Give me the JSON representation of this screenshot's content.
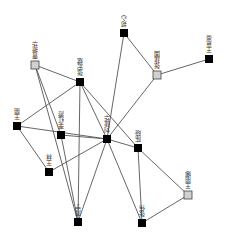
{
  "graph": {
    "type": "network",
    "nodes": [
      {
        "id": "A",
        "label": "曹振华",
        "x": 35,
        "y": 65,
        "style": "gray"
      },
      {
        "id": "B",
        "label": "张宏斌",
        "x": 80,
        "y": 82,
        "style": "black"
      },
      {
        "id": "C",
        "label": "郑心",
        "x": 124,
        "y": 33,
        "style": "black"
      },
      {
        "id": "D",
        "label": "张建国",
        "x": 157,
        "y": 75,
        "style": "gray"
      },
      {
        "id": "E",
        "label": "王嘉豪",
        "x": 209,
        "y": 59,
        "style": "black"
      },
      {
        "id": "F",
        "label": "王丽",
        "x": 17,
        "y": 126,
        "style": "black"
      },
      {
        "id": "G",
        "label": "李红霞",
        "x": 61,
        "y": 135,
        "style": "black"
      },
      {
        "id": "H",
        "label": "刘建华",
        "x": 107,
        "y": 139,
        "style": "black"
      },
      {
        "id": "I",
        "label": "陈晓",
        "x": 138,
        "y": 148,
        "style": "black"
      },
      {
        "id": "J",
        "label": "王林",
        "x": 49,
        "y": 172,
        "style": "black"
      },
      {
        "id": "K",
        "label": "王丽娜",
        "x": 188,
        "y": 195,
        "style": "gray"
      },
      {
        "id": "L",
        "label": "张伟",
        "x": 142,
        "y": 223,
        "style": "black"
      },
      {
        "id": "M",
        "label": "周宁",
        "x": 78,
        "y": 222,
        "style": "black"
      }
    ],
    "edges": [
      [
        "A",
        "B"
      ],
      [
        "A",
        "G"
      ],
      [
        "A",
        "M"
      ],
      [
        "B",
        "F"
      ],
      [
        "B",
        "H"
      ],
      [
        "B",
        "I"
      ],
      [
        "B",
        "M"
      ],
      [
        "C",
        "D"
      ],
      [
        "C",
        "H"
      ],
      [
        "D",
        "E"
      ],
      [
        "D",
        "H"
      ],
      [
        "F",
        "H"
      ],
      [
        "F",
        "J"
      ],
      [
        "G",
        "H"
      ],
      [
        "G",
        "M"
      ],
      [
        "H",
        "I"
      ],
      [
        "H",
        "J"
      ],
      [
        "H",
        "M"
      ],
      [
        "H",
        "L"
      ],
      [
        "I",
        "K"
      ],
      [
        "I",
        "L"
      ],
      [
        "K",
        "L"
      ]
    ]
  }
}
